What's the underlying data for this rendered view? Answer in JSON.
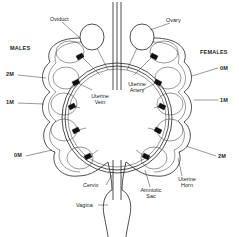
{
  "figure": {
    "type": "anatomical-diagram"
  },
  "labels": {
    "oviduct": "Oviduct",
    "ovary": "Ovary",
    "males": "MALES",
    "females": "FEMALES",
    "uterine_vein": "Uterine\nVein",
    "uterine_vein_line1": "Uterine",
    "uterine_vein_line2": "Vein",
    "uterine_artery_line1": "Uterine",
    "uterine_artery_line2": "Artery",
    "cervix": "Cervix",
    "vagina": "Vagina",
    "amniotic_sac_line1": "Amniotic",
    "amniotic_sac_line2": "Sac",
    "uterine_horn_line1": "Uterine",
    "uterine_horn_line2": "Horn"
  },
  "left_horn": {
    "group": "MALES",
    "position_labels": [
      "2M",
      "1M",
      "0M"
    ]
  },
  "right_horn": {
    "group": "FEMALES",
    "position_labels": [
      "0M",
      "1M",
      "2M"
    ]
  },
  "colors": {
    "line": "#222222",
    "background": "#ffffff",
    "fill_dark": "#111111"
  }
}
